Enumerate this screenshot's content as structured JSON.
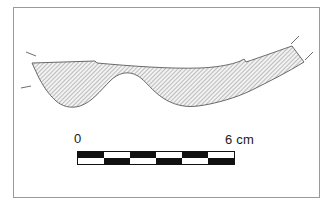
{
  "figure": {
    "type": "archaeological-artifact-profile-drawing",
    "frame": {
      "border_color": "#9a9a9a",
      "background_color": "#ffffff"
    },
    "artifact": {
      "name": "artifact-profile",
      "outline_color": "#555555",
      "hatch_color": "#8c8c8c",
      "fill_color": "#e8e8e8",
      "break_marks_left": 2,
      "break_marks_right": 2
    }
  },
  "scale": {
    "label_zero": "0",
    "label_max": "6 cm",
    "unit": "cm",
    "min_value": 0,
    "max_value": 6,
    "segments": 6,
    "bar_color": "#111111",
    "top_row": [
      "black",
      "white",
      "black",
      "white",
      "black",
      "white"
    ],
    "bottom_row": [
      "white",
      "black",
      "white",
      "black",
      "white",
      "black"
    ]
  }
}
